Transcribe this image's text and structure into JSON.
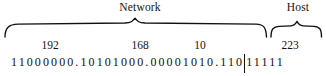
{
  "figure": {
    "ink_color": "#111111"
  },
  "braces": [
    {
      "id": "network",
      "label": "Network",
      "span_bits": 27
    },
    {
      "id": "host",
      "label": "Host",
      "span_bits": 5
    }
  ],
  "address": {
    "dotted_decimal": "192.168.10.223",
    "octets_decimal": [
      "192",
      "168",
      "10",
      "223"
    ],
    "octets_binary": [
      "11000000",
      "10101000",
      "00001010",
      "11011111"
    ],
    "separator": ".",
    "divider_glyph": "|",
    "binary_full": "11000000.10101000.00001010.11011111",
    "network_bits": "110",
    "host_bits": "11111",
    "prefix_length": "/27"
  }
}
